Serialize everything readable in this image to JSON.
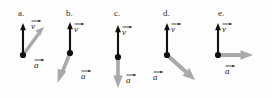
{
  "figure": {
    "kind": "physics-vector-diagram",
    "background_color": "#fdfdfd",
    "velocity_color": "#111111",
    "acceleration_color": "#a8a8a8",
    "label_color": "#2b2b2b",
    "velocity_symbol": "v",
    "acceleration_symbol": "a",
    "vector_notation": "arrow-overbar"
  },
  "panels": [
    {
      "id": "a",
      "label": "a.",
      "velocity": {
        "symbol": "v",
        "direction": "up",
        "angle_deg": 90,
        "color": "#111111"
      },
      "acceleration": {
        "symbol": "a",
        "direction": "up-right",
        "angle_deg": 45,
        "color": "#a8a8a8"
      }
    },
    {
      "id": "b",
      "label": "b.",
      "velocity": {
        "symbol": "v",
        "direction": "up",
        "angle_deg": 90,
        "color": "#111111"
      },
      "acceleration": {
        "symbol": "a",
        "direction": "down-left",
        "angle_deg": 249,
        "color": "#a8a8a8"
      }
    },
    {
      "id": "c",
      "label": "c.",
      "velocity": {
        "symbol": "v",
        "direction": "up",
        "angle_deg": 90,
        "color": "#111111"
      },
      "acceleration": {
        "symbol": "a",
        "direction": "down",
        "angle_deg": 270,
        "color": "#a8a8a8"
      }
    },
    {
      "id": "d",
      "label": "d.",
      "velocity": {
        "symbol": "v",
        "direction": "up",
        "angle_deg": 90,
        "color": "#111111"
      },
      "acceleration": {
        "symbol": "a",
        "direction": "down-right",
        "angle_deg": -42,
        "color": "#a8a8a8"
      }
    },
    {
      "id": "e",
      "label": "e.",
      "velocity": {
        "symbol": "v",
        "direction": "up",
        "angle_deg": 90,
        "color": "#111111"
      },
      "acceleration": {
        "symbol": "a",
        "direction": "right",
        "angle_deg": 0,
        "color": "#a8a8a8"
      }
    }
  ]
}
